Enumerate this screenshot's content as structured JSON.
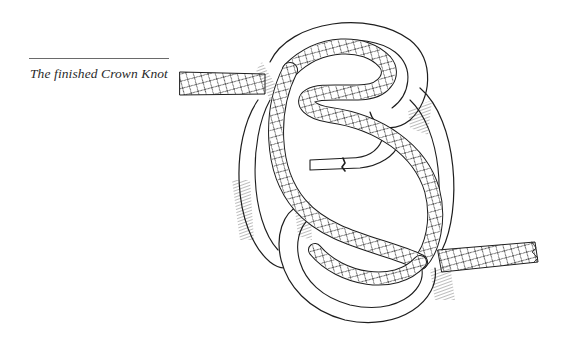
{
  "figure": {
    "caption": "The finished Crown Knot",
    "illustration_subject": "crown-knot-illustration",
    "colors": {
      "ink": "#1e1e1e",
      "rule": "#6a6a6a",
      "background": "#ffffff"
    }
  }
}
